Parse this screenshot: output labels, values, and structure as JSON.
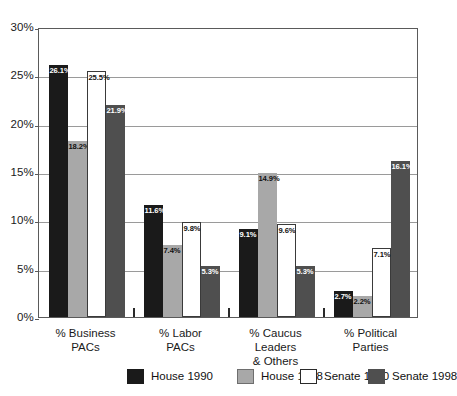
{
  "chart_data": {
    "type": "bar",
    "title": "",
    "xlabel": "",
    "ylabel": "",
    "ylim": [
      0,
      30
    ],
    "ytick_labels": [
      "30%",
      "25%",
      "20%",
      "15%",
      "10%",
      "5%",
      "0%"
    ],
    "ytick_values": [
      30,
      25,
      20,
      15,
      10,
      5,
      0
    ],
    "grid": true,
    "legend_position": "bottom",
    "categories": [
      "% Business PACs",
      "% Labor PACs",
      "% Caucus Leaders & Others",
      "% Political Parties"
    ],
    "category_lines": [
      [
        "% Business",
        "PACs"
      ],
      [
        "% Labor",
        "PACs"
      ],
      [
        "% Caucus Leaders",
        "& Others"
      ],
      [
        "% Political",
        "Parties"
      ]
    ],
    "series": [
      {
        "name": "House 1990",
        "color": "#1a1a1a",
        "values": [
          26.1,
          11.6,
          9.1,
          2.7
        ],
        "labels": [
          "26.1%",
          "11.6%",
          "9.1%",
          "2.7%"
        ]
      },
      {
        "name": "House 1998",
        "color": "#a8a8a8",
        "values": [
          18.2,
          7.4,
          14.9,
          2.2
        ],
        "labels": [
          "18.2%",
          "7.4%",
          "14.9%",
          "2.2%"
        ]
      },
      {
        "name": "Senate 1990",
        "color": "#ffffff",
        "values": [
          25.5,
          9.8,
          9.6,
          7.1
        ],
        "labels": [
          "25.5%",
          "9.8%",
          "9.6%",
          "7.1%"
        ]
      },
      {
        "name": "Senate 1998",
        "color": "#4f4f4f",
        "values": [
          21.9,
          5.3,
          5.3,
          16.1
        ],
        "labels": [
          "21.9%",
          "5.3%",
          "5.3%",
          "16.1%"
        ]
      }
    ]
  },
  "legend": {
    "items": [
      {
        "label": "House 1990"
      },
      {
        "label": "House 1998"
      },
      {
        "label": "Senate 1990"
      },
      {
        "label": "Senate 1998"
      }
    ]
  }
}
